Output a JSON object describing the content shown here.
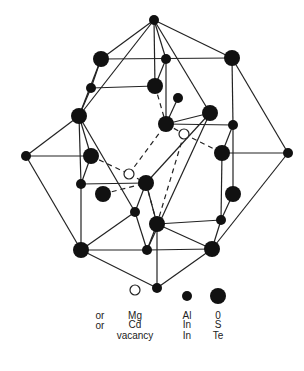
{
  "diagram": {
    "title": "",
    "nodes": [
      {
        "id": "top",
        "x": 154,
        "y": 20,
        "r": 5,
        "type": "small"
      },
      {
        "id": "n1",
        "x": 101,
        "y": 59,
        "r": 8,
        "type": "large"
      },
      {
        "id": "n2",
        "x": 91,
        "y": 88,
        "r": 5,
        "type": "small"
      },
      {
        "id": "n3",
        "x": 79,
        "y": 116,
        "r": 8,
        "type": "large"
      },
      {
        "id": "n4",
        "x": 166,
        "y": 59,
        "r": 5,
        "type": "small"
      },
      {
        "id": "n5",
        "x": 232,
        "y": 58,
        "r": 8,
        "type": "large"
      },
      {
        "id": "n6",
        "x": 155,
        "y": 86,
        "r": 8,
        "type": "large"
      },
      {
        "id": "n7",
        "x": 178,
        "y": 98,
        "r": 5,
        "type": "small"
      },
      {
        "id": "n8",
        "x": 166,
        "y": 124,
        "r": 8,
        "type": "large"
      },
      {
        "id": "n9",
        "x": 210,
        "y": 113,
        "r": 8,
        "type": "large"
      },
      {
        "id": "n10",
        "x": 233,
        "y": 125,
        "r": 5,
        "type": "small"
      },
      {
        "id": "v1",
        "x": 184,
        "y": 134,
        "r": 5,
        "type": "hollow"
      },
      {
        "id": "left",
        "x": 26,
        "y": 156,
        "r": 5,
        "type": "small"
      },
      {
        "id": "n11",
        "x": 91,
        "y": 156,
        "r": 8,
        "type": "large"
      },
      {
        "id": "n12",
        "x": 81,
        "y": 184,
        "r": 5,
        "type": "small"
      },
      {
        "id": "n13",
        "x": 103,
        "y": 194,
        "r": 8,
        "type": "large"
      },
      {
        "id": "v2",
        "x": 129,
        "y": 174,
        "r": 5,
        "type": "hollow"
      },
      {
        "id": "n14",
        "x": 146,
        "y": 183,
        "r": 8,
        "type": "large"
      },
      {
        "id": "n15",
        "x": 135,
        "y": 212,
        "r": 5,
        "type": "small"
      },
      {
        "id": "n16",
        "x": 222,
        "y": 153,
        "r": 8,
        "type": "large"
      },
      {
        "id": "right",
        "x": 288,
        "y": 153,
        "r": 5,
        "type": "small"
      },
      {
        "id": "n17",
        "x": 233,
        "y": 194,
        "r": 8,
        "type": "large"
      },
      {
        "id": "n18",
        "x": 221,
        "y": 220,
        "r": 5,
        "type": "small"
      },
      {
        "id": "n19",
        "x": 157,
        "y": 224,
        "r": 8,
        "type": "large"
      },
      {
        "id": "n20",
        "x": 81,
        "y": 250,
        "r": 8,
        "type": "large"
      },
      {
        "id": "n21",
        "x": 147,
        "y": 250,
        "r": 5,
        "type": "small"
      },
      {
        "id": "n22",
        "x": 212,
        "y": 249,
        "r": 8,
        "type": "large"
      },
      {
        "id": "bottom",
        "x": 157,
        "y": 288,
        "r": 5,
        "type": "small"
      }
    ],
    "edges": [
      [
        "top",
        "n1"
      ],
      [
        "top",
        "n3"
      ],
      [
        "top",
        "n4"
      ],
      [
        "top",
        "n5"
      ],
      [
        "top",
        "n9"
      ],
      [
        "top",
        "n6"
      ],
      [
        "n1",
        "n5"
      ],
      [
        "n1",
        "n2"
      ],
      [
        "n1",
        "n3"
      ],
      [
        "n2",
        "n3"
      ],
      [
        "n2",
        "n6"
      ],
      [
        "n4",
        "n8"
      ],
      [
        "n4",
        "n6"
      ],
      [
        "n5",
        "n10"
      ],
      [
        "n5",
        "right"
      ],
      [
        "n3",
        "left"
      ],
      [
        "n3",
        "n11"
      ],
      [
        "n3",
        "n12"
      ],
      [
        "n3",
        "n15"
      ],
      [
        "n8",
        "n10"
      ],
      [
        "n9",
        "n8"
      ],
      [
        "n10",
        "n16"
      ],
      [
        "n10",
        "n17"
      ],
      [
        "left",
        "n11"
      ],
      [
        "left",
        "n20"
      ],
      [
        "n11",
        "n12"
      ],
      [
        "n12",
        "n14"
      ],
      [
        "n12",
        "n20"
      ],
      [
        "n9",
        "n14"
      ],
      [
        "n9",
        "n21"
      ],
      [
        "n14",
        "n15"
      ],
      [
        "n15",
        "n21"
      ],
      [
        "n15",
        "n20"
      ],
      [
        "n16",
        "right"
      ],
      [
        "n16",
        "n18"
      ],
      [
        "n17",
        "n18"
      ],
      [
        "right",
        "n22"
      ],
      [
        "n19",
        "n21"
      ],
      [
        "n19",
        "n18"
      ],
      [
        "n19",
        "n22"
      ],
      [
        "n19",
        "bottom"
      ],
      [
        "n19",
        "n14"
      ],
      [
        "n20",
        "n21"
      ],
      [
        "n21",
        "n22"
      ],
      [
        "n20",
        "bottom"
      ],
      [
        "n22",
        "bottom"
      ],
      [
        "n7",
        "n8"
      ],
      [
        "n18",
        "n22"
      ]
    ],
    "dashed_edges": [
      [
        "n11",
        "v2"
      ],
      [
        "v2",
        "n14"
      ],
      [
        "v2",
        "n8"
      ],
      [
        "n6",
        "n8"
      ],
      [
        "n8",
        "v1"
      ],
      [
        "v1",
        "n16"
      ],
      [
        "v1",
        "n19"
      ],
      [
        "n13",
        "n14"
      ],
      [
        "n14",
        "n19"
      ]
    ]
  },
  "legend": {
    "symbols": [
      {
        "type": "hollow",
        "x": 135,
        "y": 290,
        "r": 5
      },
      {
        "type": "small",
        "x": 187,
        "y": 296,
        "r": 5
      },
      {
        "type": "large",
        "x": 218,
        "y": 296,
        "r": 8
      }
    ],
    "rows": [
      {
        "prefix": "",
        "col1": "Mg",
        "col2": "Al",
        "col3": "0"
      },
      {
        "prefix": "or",
        "col1": "Cd",
        "col2": "In",
        "col3": "S"
      },
      {
        "prefix": "or",
        "col1": "vacancy",
        "col2": "In",
        "col3": "Te"
      }
    ]
  }
}
